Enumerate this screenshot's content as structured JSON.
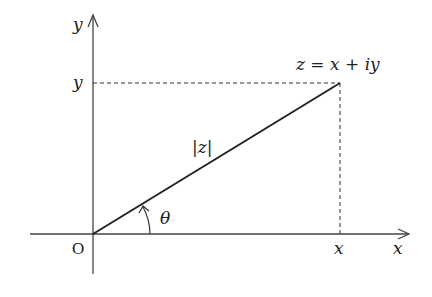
{
  "diagram": {
    "axes": {
      "x_axis_label": "x",
      "y_axis_label": "y",
      "origin_label": "O"
    },
    "point": {
      "label": "z = x + iy",
      "x_projection_label": "x",
      "y_projection_label": "y"
    },
    "modulus_label": "|z|",
    "angle_label": "θ",
    "colors": {
      "line": "#222222",
      "axis": "#444444",
      "dashed": "#333333",
      "background": "#ffffff"
    }
  }
}
